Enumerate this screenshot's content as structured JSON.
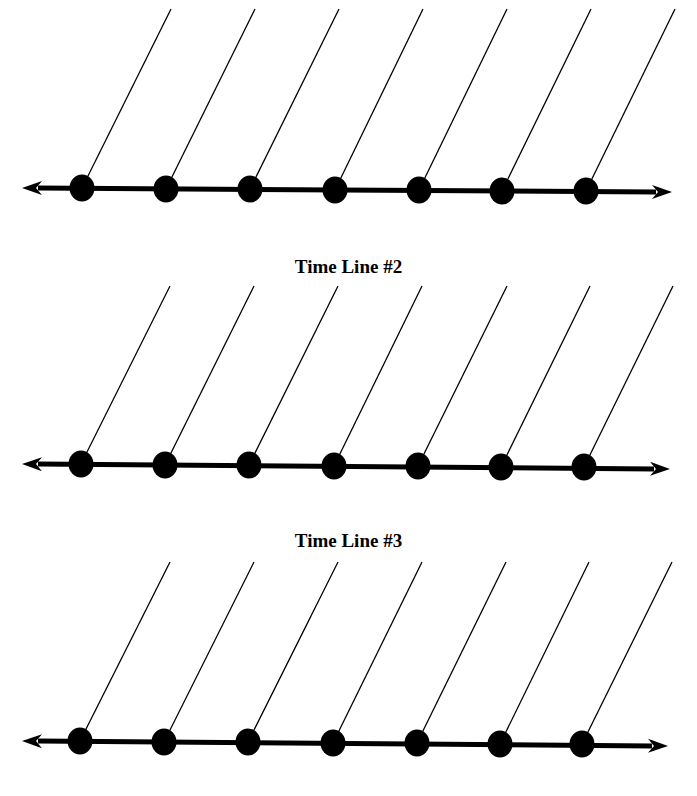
{
  "colors": {
    "ink": "#000000",
    "background": "#ffffff"
  },
  "timelines": [
    {
      "title": "",
      "axis": {
        "x1": 22,
        "y1": 188,
        "x2": 672,
        "y2": 192
      },
      "top_y": 9,
      "points": [
        {
          "x": 82,
          "y": 188,
          "top_x": 171
        },
        {
          "x": 166,
          "y": 189,
          "top_x": 255
        },
        {
          "x": 250,
          "y": 189,
          "top_x": 339
        },
        {
          "x": 335,
          "y": 190,
          "top_x": 423
        },
        {
          "x": 419,
          "y": 190,
          "top_x": 507
        },
        {
          "x": 502,
          "y": 191,
          "top_x": 591
        },
        {
          "x": 586,
          "y": 191,
          "top_x": 675
        }
      ]
    },
    {
      "title": "Time Line #2",
      "title_y": 256,
      "axis": {
        "x1": 22,
        "y1": 464,
        "x2": 670,
        "y2": 469
      },
      "top_y": 286,
      "points": [
        {
          "x": 81,
          "y": 464,
          "top_x": 170
        },
        {
          "x": 165,
          "y": 465,
          "top_x": 254
        },
        {
          "x": 249,
          "y": 465,
          "top_x": 338
        },
        {
          "x": 334,
          "y": 466,
          "top_x": 422
        },
        {
          "x": 418,
          "y": 466,
          "top_x": 507
        },
        {
          "x": 501,
          "y": 467,
          "top_x": 590
        },
        {
          "x": 584,
          "y": 467,
          "top_x": 673
        }
      ]
    },
    {
      "title": "Time Line #3",
      "title_y": 530,
      "axis": {
        "x1": 22,
        "y1": 741,
        "x2": 668,
        "y2": 746
      },
      "top_y": 562,
      "points": [
        {
          "x": 80,
          "y": 741,
          "top_x": 170
        },
        {
          "x": 164,
          "y": 742,
          "top_x": 254
        },
        {
          "x": 248,
          "y": 742,
          "top_x": 338
        },
        {
          "x": 333,
          "y": 743,
          "top_x": 422
        },
        {
          "x": 417,
          "y": 743,
          "top_x": 506
        },
        {
          "x": 500,
          "y": 744,
          "top_x": 589
        },
        {
          "x": 582,
          "y": 744,
          "top_x": 672
        }
      ]
    }
  ]
}
